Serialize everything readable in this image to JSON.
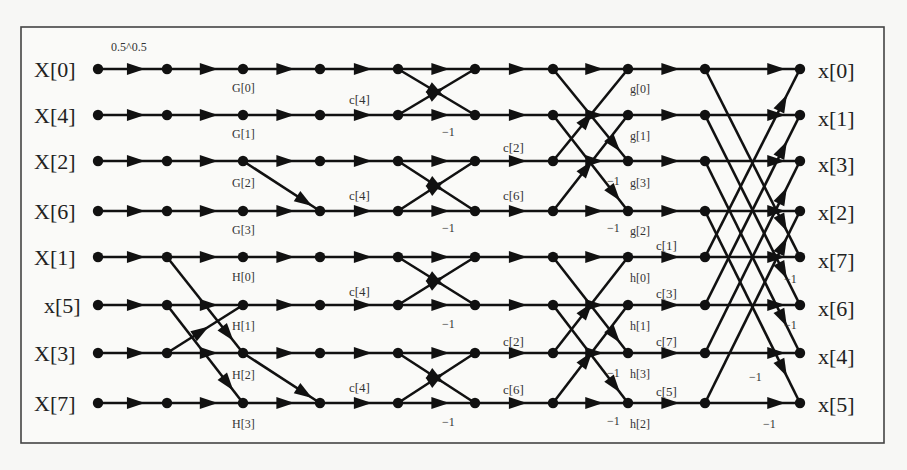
{
  "diagram": {
    "frame": {
      "x": 21,
      "y": 27,
      "width": 863,
      "height": 416
    },
    "columns": [
      98,
      167,
      243,
      320,
      398,
      475,
      553,
      628,
      705,
      800
    ],
    "rows": [
      69,
      115,
      161,
      211,
      257,
      305,
      353,
      403
    ],
    "inputs": [
      "X[0]",
      "X[4]",
      "X[2]",
      "X[6]",
      "X[1]",
      "x[5]",
      "X[3]",
      "X[7]"
    ],
    "outputs": [
      "x[0]",
      "x[1]",
      "x[3]",
      "x[2]",
      "x[7]",
      "x[6]",
      "x[4]",
      "x[5]"
    ],
    "scale_label": "0.5^0.5",
    "stage_labels": {
      "G": [
        "G[0]",
        "G[1]",
        "G[2]",
        "G[3]"
      ],
      "H": [
        "H[0]",
        "H[1]",
        "H[2]",
        "H[3]"
      ],
      "g": [
        "g[0]",
        "g[1]",
        "g[3]",
        "g[2]"
      ],
      "h": [
        "h[0]",
        "h[1]",
        "h[3]",
        "h[2]"
      ]
    },
    "coefficients": {
      "c4_a": "c[4]",
      "c4_b": "c[4]",
      "c4_c": "c[4]",
      "c4_d": "c[4]",
      "c2_a": "c[2]",
      "c6_a": "c[6]",
      "c2_b": "c[2]",
      "c6_b": "c[6]",
      "c1": "c[1]",
      "c3": "c[3]",
      "c7": "c[7]",
      "c5": "c[5]"
    },
    "minus_one": "−1"
  }
}
